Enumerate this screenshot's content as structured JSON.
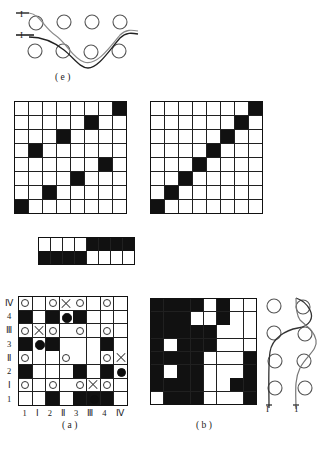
{
  "figure": {
    "captions": {
      "e": "( e )",
      "a": "( a )",
      "b": "( b )"
    }
  },
  "panel_e": {
    "name": "curve-through-circle-lattice",
    "labels": [
      {
        "text": "I",
        "position": "upper-left"
      },
      {
        "text": "I",
        "position": "mid-left"
      }
    ],
    "circle_rows": 2,
    "circles_per_row": 4
  },
  "panel_right": {
    "name": "vertical-curve-through-circle-lattice",
    "labels": [
      {
        "text": "I",
        "position": "bottom-left"
      },
      {
        "text": "1",
        "position": "bottom-right"
      }
    ],
    "circle_rows": 4,
    "circles_per_row": 2
  },
  "grid_topleft": {
    "name": "scattered-cells-grid",
    "rows": 8,
    "cols": 8,
    "cells": [
      [
        0,
        0,
        0,
        0,
        0,
        0,
        0,
        1
      ],
      [
        0,
        0,
        0,
        0,
        0,
        1,
        0,
        0
      ],
      [
        0,
        0,
        0,
        1,
        0,
        0,
        0,
        0
      ],
      [
        0,
        1,
        0,
        0,
        0,
        0,
        0,
        0
      ],
      [
        0,
        0,
        0,
        0,
        0,
        0,
        1,
        0
      ],
      [
        0,
        0,
        0,
        0,
        1,
        0,
        0,
        0
      ],
      [
        0,
        0,
        1,
        0,
        0,
        0,
        0,
        0
      ],
      [
        1,
        0,
        0,
        0,
        0,
        0,
        0,
        0
      ]
    ]
  },
  "grid_topright": {
    "name": "antidiagonal-grid",
    "rows": 8,
    "cols": 8,
    "cells": [
      [
        0,
        0,
        0,
        0,
        0,
        0,
        0,
        1
      ],
      [
        0,
        0,
        0,
        0,
        0,
        0,
        1,
        0
      ],
      [
        0,
        0,
        0,
        0,
        0,
        1,
        0,
        0
      ],
      [
        0,
        0,
        0,
        0,
        1,
        0,
        0,
        0
      ],
      [
        0,
        0,
        0,
        1,
        0,
        0,
        0,
        0
      ],
      [
        0,
        0,
        1,
        0,
        0,
        0,
        0,
        0
      ],
      [
        0,
        1,
        0,
        0,
        0,
        0,
        0,
        0
      ],
      [
        1,
        0,
        0,
        0,
        0,
        0,
        0,
        0
      ]
    ]
  },
  "grid_strip": {
    "name": "two-row-half-filled-strip",
    "rows": 2,
    "cols": 8,
    "cells": [
      [
        0,
        0,
        0,
        0,
        1,
        1,
        1,
        1
      ],
      [
        1,
        1,
        1,
        1,
        0,
        0,
        0,
        0
      ]
    ]
  },
  "grid_b": {
    "name": "panel-b-grid",
    "rows": 8,
    "cols": 8,
    "cells": [
      [
        1,
        1,
        1,
        1,
        0,
        1,
        0,
        0
      ],
      [
        1,
        1,
        1,
        0,
        0,
        1,
        0,
        0
      ],
      [
        1,
        1,
        1,
        1,
        1,
        0,
        0,
        0
      ],
      [
        1,
        0,
        1,
        1,
        1,
        0,
        0,
        0
      ],
      [
        1,
        1,
        1,
        1,
        0,
        0,
        0,
        1
      ],
      [
        1,
        0,
        1,
        1,
        0,
        0,
        0,
        1
      ],
      [
        1,
        1,
        1,
        1,
        0,
        0,
        1,
        1
      ],
      [
        0,
        1,
        1,
        1,
        0,
        0,
        0,
        1
      ]
    ]
  },
  "panel_a": {
    "name": "annotated-lattice-grid",
    "rows": 8,
    "cols": 8,
    "y_ticks": [
      "Ⅳ",
      "4",
      "Ⅲ",
      "3",
      "Ⅱ",
      "2",
      "Ⅰ",
      "1"
    ],
    "x_ticks": [
      "1",
      "Ⅰ",
      "2",
      "Ⅱ",
      "3",
      "Ⅲ",
      "4",
      "Ⅳ"
    ],
    "cells": [
      [
        0,
        0,
        0,
        0,
        0,
        0,
        0,
        0
      ],
      [
        1,
        0,
        1,
        0,
        1,
        0,
        0,
        0
      ],
      [
        0,
        0,
        0,
        0,
        0,
        0,
        0,
        0
      ],
      [
        1,
        0,
        1,
        0,
        0,
        0,
        1,
        0
      ],
      [
        0,
        0,
        0,
        0,
        0,
        0,
        0,
        0
      ],
      [
        1,
        0,
        0,
        0,
        1,
        0,
        1,
        0
      ],
      [
        0,
        0,
        0,
        0,
        0,
        0,
        0,
        0
      ],
      [
        0,
        0,
        1,
        0,
        1,
        1,
        1,
        0
      ]
    ],
    "marks": [
      [
        "circle",
        "",
        "circle",
        "x",
        "circle",
        "",
        "circle",
        ""
      ],
      [
        "",
        "",
        "",
        "dot",
        "",
        "",
        "",
        ""
      ],
      [
        "circle",
        "x",
        "circle",
        "",
        "circle",
        "",
        "circle",
        ""
      ],
      [
        "",
        "dot",
        "",
        "",
        "",
        "",
        "",
        ""
      ],
      [
        "circle",
        "",
        "",
        "circle",
        "",
        "",
        "circle",
        "x"
      ],
      [
        "",
        "",
        "",
        "",
        "",
        "",
        "",
        "dot"
      ],
      [
        "circle",
        "",
        "circle",
        "",
        "circle",
        "x",
        "circle",
        ""
      ],
      [
        "",
        "",
        "",
        "",
        "",
        "dot",
        "",
        ""
      ]
    ]
  },
  "colors": {
    "ink": "#111111",
    "paper": "#ffffff",
    "line": "#333333"
  }
}
